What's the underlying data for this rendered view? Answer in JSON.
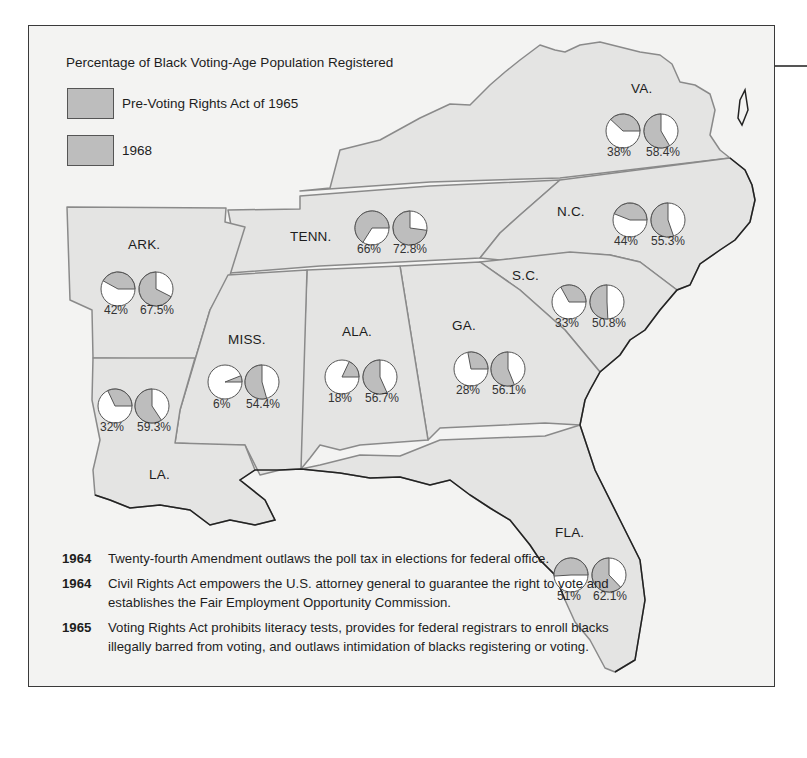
{
  "legend": {
    "title": "Percentage of Black Voting-Age Population Registered",
    "items": [
      {
        "label": "Pre-Voting Rights Act of 1965",
        "color": "#bdbdbd"
      },
      {
        "label": "1968",
        "color": "#bdbdbd"
      }
    ]
  },
  "states": [
    {
      "abbr": "VA.",
      "pre1965": "38%",
      "y1968": "58.4%"
    },
    {
      "abbr": "N.C.",
      "pre1965": "44%",
      "y1968": "55.3%"
    },
    {
      "abbr": "TENN.",
      "pre1965": "66%",
      "y1968": "72.8%"
    },
    {
      "abbr": "ARK.",
      "pre1965": "42%",
      "y1968": "67.5%"
    },
    {
      "abbr": "S.C.",
      "pre1965": "33%",
      "y1968": "50.8%"
    },
    {
      "abbr": "MISS.",
      "pre1965": "6%",
      "y1968": "54.4%"
    },
    {
      "abbr": "ALA.",
      "pre1965": "18%",
      "y1968": "56.7%"
    },
    {
      "abbr": "GA.",
      "pre1965": "28%",
      "y1968": "56.1%"
    },
    {
      "abbr": "LA.",
      "pre1965": "32%",
      "y1968": "59.3%"
    },
    {
      "abbr": "FLA.",
      "pre1965": "51%",
      "y1968": "62.1%"
    }
  ],
  "timeline": [
    {
      "year": "1964",
      "text": "Twenty-fourth Amendment outlaws the poll tax in elections for federal office."
    },
    {
      "year": "1964",
      "text": "Civil Rights Act empowers the U.S. attorney general to guarantee the right to vote and establishes the Fair Employment Opportunity Commission."
    },
    {
      "year": "1965",
      "text": "Voting Rights Act prohibits literacy tests, provides for federal registrars to enroll blacks illegally barred from voting, and outlaws intimidation of blacks registering or voting."
    }
  ],
  "colors": {
    "land": "#e4e4e3",
    "background": "#f3f3f2",
    "pie_fill": "#bdbdbd",
    "border": "#8a8a8a"
  }
}
